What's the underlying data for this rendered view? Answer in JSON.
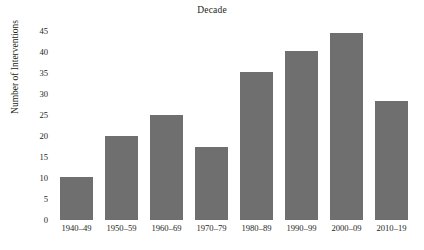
{
  "chart_data": {
    "type": "bar",
    "title": "Decade",
    "xlabel": "",
    "ylabel": "Number of Interventions",
    "categories": [
      "1940–49",
      "1950–59",
      "1960–69",
      "1970–79",
      "1980–89",
      "1990–99",
      "2000–09",
      "2010–19"
    ],
    "values": [
      10.2,
      20.1,
      25.1,
      17.4,
      35.3,
      40.4,
      44.5,
      28.4
    ],
    "ylim": [
      0,
      46
    ],
    "yticks": [
      0,
      5,
      10,
      15,
      20,
      25,
      30,
      35,
      40,
      45
    ],
    "ytick_labels": [
      "0",
      "5",
      "10",
      "15",
      "20",
      "25",
      "30",
      "35",
      "40",
      "45"
    ],
    "grid": false,
    "legend": "none",
    "bar_color": "#6f6f6f",
    "background_color": "#ffffff",
    "text_color": "#231f20"
  }
}
